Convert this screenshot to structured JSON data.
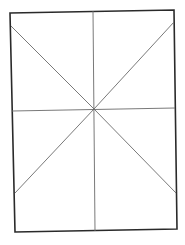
{
  "diagram": {
    "background": "#ffffff",
    "stroke_frame": "#2a2a2a",
    "stroke_lines": "#6a6a6a",
    "frame": {
      "points": "10,13 174,10 177,229 15,232"
    },
    "lines": [
      {
        "name": "vertical-midline",
        "x1": 93,
        "y1": 11,
        "x2": 95,
        "y2": 231
      },
      {
        "name": "horizontal-midline",
        "x1": 12,
        "y1": 111,
        "x2": 175,
        "y2": 108
      },
      {
        "name": "diagonal-top-left",
        "x1": 11,
        "y1": 26,
        "x2": 94,
        "y2": 109
      },
      {
        "name": "diagonal-top-right",
        "x1": 174,
        "y1": 22,
        "x2": 94,
        "y2": 109
      },
      {
        "name": "diagonal-bottom-left",
        "x1": 15,
        "y1": 193,
        "x2": 94,
        "y2": 109
      },
      {
        "name": "diagonal-bottom-right",
        "x1": 176,
        "y1": 193,
        "x2": 94,
        "y2": 109
      }
    ]
  }
}
